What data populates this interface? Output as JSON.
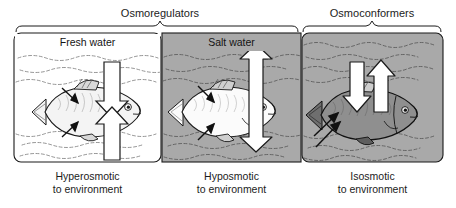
{
  "figure": {
    "title_groups": [
      {
        "label": "Osmoregulators",
        "x": 160,
        "y": 8,
        "brace_left": 16,
        "brace_right": 298,
        "brace_peak": 160
      },
      {
        "label": "Osmoconformers",
        "x": 372,
        "y": 8,
        "brace_left": 303,
        "brace_right": 441,
        "brace_peak": 372
      }
    ],
    "panels": [
      {
        "name": "fresh-water",
        "water_label": "Fresh water",
        "caption_line1": "Hyperosmotic",
        "caption_line2": "to environment",
        "background": "#ffffff",
        "fish_fill": "#f2f2f2",
        "arrow_type": "double-headed-hourglass",
        "x": 14,
        "width": 147
      },
      {
        "name": "salt-water",
        "water_label": "Salt water",
        "caption_line1": "Hyposmotic",
        "caption_line2": "to environment",
        "background": "#a9a9a9",
        "fish_fill": "#fbfbfb",
        "arrow_type": "double-headed-arrow",
        "x": 162,
        "width": 139
      },
      {
        "name": "isosmotic-water",
        "water_label": "",
        "caption_line1": "Isosmotic",
        "caption_line2": "to environment",
        "background": "#a9a9a9",
        "fish_fill": "#8f8f8f",
        "arrow_type": "separate-up-and-down-arrows",
        "x": 302,
        "width": 141
      }
    ],
    "colors": {
      "outline": "#1a1a1a",
      "water_line": "#555555",
      "arrow_fill": "#ffffff",
      "gray_water": "#a9a9a9",
      "white_water": "#ffffff"
    }
  }
}
